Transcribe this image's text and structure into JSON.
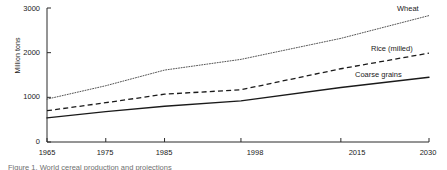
{
  "chart_data": {
    "type": "line",
    "title": "",
    "subtitle": "",
    "xlabel": "",
    "ylabel": "Million tons",
    "x": [
      1965,
      1975,
      1985,
      1998,
      2015,
      2030
    ],
    "xtick_labels": [
      "1965",
      "1975",
      "1985",
      "1998",
      "2015",
      "2030"
    ],
    "ytick_labels": [
      "0",
      "1000",
      "2000",
      "3000"
    ],
    "ytick_values": [
      0,
      1000,
      2000,
      3000
    ],
    "xlim": [
      1965,
      2030
    ],
    "ylim": [
      0,
      3000
    ],
    "grid": false,
    "legend_position": "line-end-labels",
    "series": [
      {
        "name": "Wheat",
        "style": "dotted",
        "color": "#555555",
        "values": [
          960,
          1260,
          1610,
          1850,
          2320,
          2830
        ]
      },
      {
        "name": "Rice (milled)",
        "style": "dashed",
        "color": "#1a1a1a",
        "values": [
          700,
          880,
          1070,
          1170,
          1640,
          1990
        ]
      },
      {
        "name": "Coarse grains",
        "style": "solid",
        "color": "#1a1a1a",
        "values": [
          540,
          680,
          800,
          920,
          1220,
          1450
        ]
      }
    ],
    "annotations": [
      {
        "text": "Wheat",
        "series": "Wheat"
      },
      {
        "text": "Rice (milled)",
        "series": "Rice (milled)"
      },
      {
        "text": "Coarse grains",
        "series": "Coarse grains"
      }
    ]
  },
  "caption": {
    "text": "Figure 1. World cereal production and projections"
  }
}
